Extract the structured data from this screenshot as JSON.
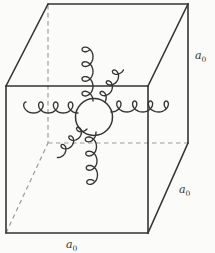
{
  "figure": {
    "kind": "line-drawing"
  },
  "labels": {
    "edge_right": {
      "base": "a",
      "sub": "0"
    },
    "edge_lower_right": {
      "base": "a",
      "sub": "0"
    },
    "edge_bottom": {
      "base": "a",
      "sub": "0"
    }
  },
  "counts": {
    "gluon_coils": 6
  },
  "colors": {
    "background": "#fbfbf9",
    "edge_line": "#343434",
    "hidden_edge_line": "#9b9b9b",
    "coil_line": "#343434",
    "sphere_fill": "#fbfbf9"
  }
}
